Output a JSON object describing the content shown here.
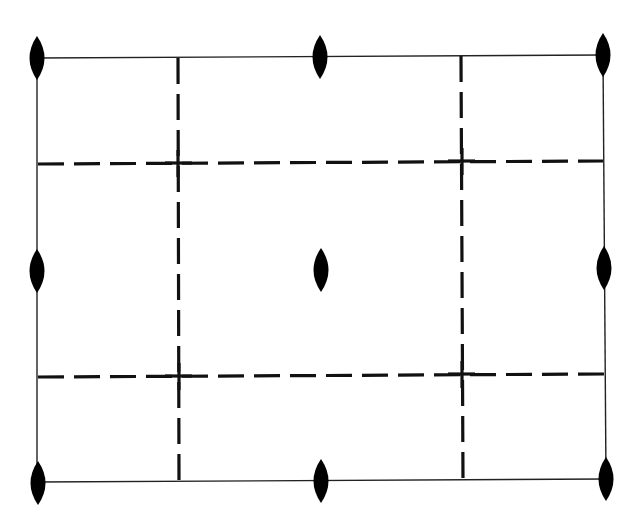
{
  "diagram": {
    "type": "plane-group symmetry diagram",
    "colors": {
      "background": "#ffffff",
      "lines": "#111111",
      "symbols": "#000000"
    },
    "unit_cell": {
      "corners": [
        [
          37,
          58
        ],
        [
          603,
          55
        ],
        [
          606,
          479
        ],
        [
          37,
          482
        ]
      ]
    },
    "glide_lines": {
      "vertical_x": [
        178,
        461
      ],
      "horizontal_y": [
        163,
        375
      ]
    },
    "twofold_axes": [
      {
        "name": "corner-top-left",
        "x": 37,
        "y": 58
      },
      {
        "name": "edge-top-mid",
        "x": 320,
        "y": 57
      },
      {
        "name": "corner-top-right",
        "x": 603,
        "y": 55
      },
      {
        "name": "edge-left-mid",
        "x": 37,
        "y": 271
      },
      {
        "name": "center",
        "x": 321,
        "y": 270
      },
      {
        "name": "edge-right-mid",
        "x": 604,
        "y": 268
      },
      {
        "name": "corner-bottom-left",
        "x": 38,
        "y": 483
      },
      {
        "name": "edge-bottom-mid",
        "x": 321,
        "y": 481
      },
      {
        "name": "corner-bottom-right",
        "x": 606,
        "y": 479
      }
    ]
  }
}
